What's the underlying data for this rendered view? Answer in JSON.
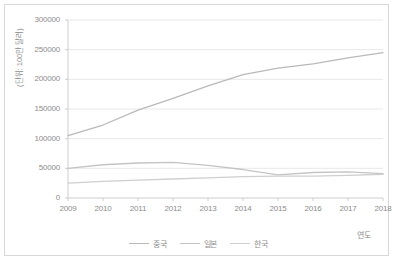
{
  "chart_data": {
    "type": "line",
    "title": "",
    "xlabel": "연도",
    "ylabel": "(단위: 100만 달러)",
    "categories": [
      "2009",
      "2010",
      "2011",
      "2012",
      "2013",
      "2014",
      "2015",
      "2016",
      "2017",
      "2018"
    ],
    "x": [
      2009,
      2010,
      2011,
      2012,
      2013,
      2014,
      2015,
      2016,
      2017,
      2018
    ],
    "ylim": [
      0,
      300000
    ],
    "ytick_labels": [
      "0",
      "50000",
      "100000",
      "150000",
      "200000",
      "250000",
      "300000"
    ],
    "ytick_values": [
      0,
      50000,
      100000,
      150000,
      200000,
      250000,
      300000
    ],
    "grid": true,
    "legend_position": "bottom",
    "series": [
      {
        "name": "중국",
        "color": "#b9b9b9",
        "values": [
          105000,
          123000,
          148000,
          168000,
          189000,
          208000,
          219000,
          226000,
          236000,
          245000
        ]
      },
      {
        "name": "일본",
        "color": "#c4c4c4",
        "values": [
          50000,
          56000,
          59000,
          60000,
          55000,
          48000,
          39000,
          43000,
          44000,
          41000
        ]
      },
      {
        "name": "한국",
        "color": "#cfcfcf",
        "values": [
          25000,
          28000,
          30000,
          32000,
          34000,
          36000,
          37000,
          37000,
          38000,
          40000
        ]
      }
    ]
  },
  "axis": {
    "y_label_text": "(단위: 100만 달러)",
    "x_label_text": "연도"
  },
  "legend": {
    "items": [
      {
        "label": "중국"
      },
      {
        "label": "일본"
      },
      {
        "label": "한국"
      }
    ]
  },
  "style": {
    "border_color": "#d8d8d8",
    "grid_color": "#e2e2e2",
    "axis_color": "#c8c8c8",
    "text_color": "#8c8c8c",
    "background": "#ffffff"
  }
}
